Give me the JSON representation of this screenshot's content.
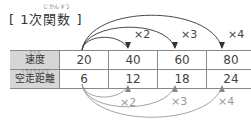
{
  "title": {
    "text": "[ 1次関数 ]",
    "ruby": "じかんすう"
  },
  "table": {
    "rows": [
      {
        "label": "速度",
        "ruby": "そくど",
        "values": [
          "20",
          "40",
          "60",
          "80"
        ]
      },
      {
        "label": "空走距離",
        "ruby": "くうそうきょり",
        "values": [
          "6",
          "12",
          "18",
          "24"
        ]
      }
    ]
  },
  "arrows": {
    "top": {
      "color": "#333333",
      "labels": [
        "×2",
        "×3",
        "×4"
      ]
    },
    "bottom": {
      "color": "#999999",
      "labels": [
        "×2",
        "×3",
        "×4"
      ]
    }
  }
}
